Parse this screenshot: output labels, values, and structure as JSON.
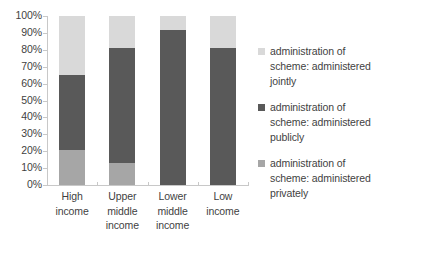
{
  "chart_data": {
    "type": "bar",
    "subtype": "stacked-100-percent-column",
    "title": "",
    "xlabel": "",
    "ylabel": "",
    "ylim": [
      0,
      100
    ],
    "yticks": [
      "0%",
      "10%",
      "20%",
      "30%",
      "40%",
      "50%",
      "60%",
      "70%",
      "80%",
      "90%",
      "100%"
    ],
    "grid": false,
    "legend_position": "right",
    "categories": [
      "High income",
      "Upper middle income",
      "Lower middle income",
      "Low income"
    ],
    "category_lines": [
      [
        "High",
        "income"
      ],
      [
        "Upper",
        "middle",
        "income"
      ],
      [
        "Lower",
        "middle",
        "income"
      ],
      [
        "Low",
        "income"
      ]
    ],
    "series": [
      {
        "name": "administration of scheme: administered privately",
        "color": "#a6a6a6",
        "values": [
          21,
          13,
          0,
          0
        ]
      },
      {
        "name": "administration of scheme: administered publicly",
        "color": "#595959",
        "values": [
          44,
          68,
          92,
          81
        ]
      },
      {
        "name": "administration of scheme: administered jointly",
        "color": "#d9d9d9",
        "values": [
          35,
          19,
          8,
          19
        ]
      }
    ]
  },
  "legend": {
    "items": [
      {
        "label": "administration of scheme: administered jointly",
        "color": "#d9d9d9",
        "lines": [
          "administration of",
          "scheme: administered",
          "jointly"
        ]
      },
      {
        "label": "administration of scheme: administered publicly",
        "color": "#595959",
        "lines": [
          "administration of",
          "scheme: administered",
          "publicly"
        ]
      },
      {
        "label": "administration of scheme: administered privately",
        "color": "#a6a6a6",
        "lines": [
          "administration of",
          "scheme: administered",
          "privately"
        ]
      }
    ]
  },
  "axes": {
    "y_tick_labels": [
      "100%",
      "90%",
      "80%",
      "70%",
      "60%",
      "50%",
      "40%",
      "30%",
      "20%",
      "10%",
      "0%"
    ],
    "axis_color": "#c8c8c8",
    "text_color": "#3f3f3f"
  }
}
